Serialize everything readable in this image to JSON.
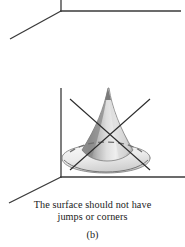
{
  "figure": {
    "panel_label": "(b)",
    "caption_lines": [
      "The surface should not have",
      "jumps or corners"
    ],
    "colors": {
      "axis": "#3a3a3a",
      "cross_mark": "#2b2b2b",
      "surface_outline": "#6b6b6b",
      "surface_light": "#f2f2f2",
      "surface_mid": "#c9c9c9",
      "surface_dark": "#8e8e8e",
      "dashed_hidden_edge": "#7a7a7a",
      "text": "#1a1a1a",
      "background": "#ffffff"
    },
    "upper_panel": {
      "name": "partial-axes-of-previous-figure",
      "origin": {
        "x": 61,
        "y": 11
      },
      "vertical_axis_top": {
        "x": 61,
        "y": 0
      },
      "horizontal_axis_end": {
        "x": 181,
        "y": 11
      },
      "depth_axis_end": {
        "x": 10,
        "y": 39
      }
    },
    "lower_panel": {
      "name": "horn-surface-with-corner",
      "origin": {
        "x": 61,
        "y": 177
      },
      "vertical_axis_top": {
        "x": 61,
        "y": 88
      },
      "horizontal_axis_end": {
        "x": 185,
        "y": 177
      },
      "depth_axis_end": {
        "x": 9,
        "y": 203
      },
      "surface": {
        "type": "horn-cone",
        "apex": {
          "x": 108,
          "y": 88
        },
        "base_center": {
          "x": 106,
          "y": 160
        },
        "base_radius_x": 38,
        "base_radius_y": 10,
        "rim_radius_x": 44,
        "rim_radius_y": 11,
        "has_sharp_corner_at_apex": true
      },
      "cross_mark": {
        "name": "x-strikethrough",
        "line_1": {
          "x1": 70,
          "y1": 99,
          "x2": 150,
          "y2": 170
        },
        "line_2": {
          "x1": 150,
          "y1": 99,
          "x2": 70,
          "y2": 170
        }
      }
    }
  }
}
